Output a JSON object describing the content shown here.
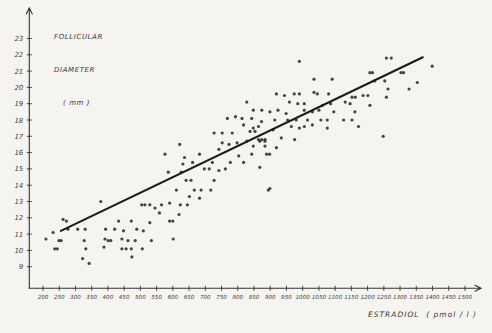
{
  "figure": {
    "y_axis_title": {
      "line1": "FOLLICULAR",
      "line2": "DIAMETER",
      "line3": "( mm )"
    },
    "x_axis_title": "ESTRADIOL  ( pmol / l )"
  },
  "chart_data": {
    "type": "scatter",
    "title": "",
    "xlabel": "ESTRADIOL (pmol/l)",
    "ylabel": "FOLLICULAR DIAMETER (mm)",
    "xlim": [
      150,
      1550
    ],
    "ylim": [
      8,
      24
    ],
    "grid": false,
    "legend": "none",
    "x_ticks": [
      200,
      250,
      300,
      350,
      400,
      450,
      500,
      550,
      600,
      650,
      700,
      750,
      800,
      850,
      900,
      950,
      1000,
      1050,
      1100,
      1150,
      1200,
      1250,
      1300,
      1350,
      1400,
      1450,
      1500
    ],
    "y_ticks": [
      9,
      10,
      11,
      12,
      13,
      14,
      15,
      16,
      17,
      18,
      19,
      20,
      21,
      22,
      23
    ],
    "point_color": "#2e2c28",
    "line_color": "#1d1b17",
    "trend_line": {
      "x1": 255,
      "y1": 11.2,
      "x2": 1370,
      "y2": 21.85
    },
    "points": [
      [
        209,
        10.7
      ],
      [
        231,
        11.1
      ],
      [
        236,
        10.1
      ],
      [
        244,
        10.1
      ],
      [
        249,
        10.6
      ],
      [
        256,
        10.6
      ],
      [
        262,
        11.9
      ],
      [
        272,
        11.8
      ],
      [
        277,
        11.3
      ],
      [
        307,
        11.3
      ],
      [
        322,
        9.5
      ],
      [
        327,
        10.6
      ],
      [
        330,
        11.3
      ],
      [
        332,
        10.1
      ],
      [
        342,
        9.2
      ],
      [
        378,
        13.0
      ],
      [
        388,
        10.2
      ],
      [
        391,
        10.7
      ],
      [
        393,
        11.3
      ],
      [
        401,
        10.6
      ],
      [
        409,
        10.6
      ],
      [
        421,
        11.3
      ],
      [
        433,
        11.8
      ],
      [
        443,
        10.7
      ],
      [
        443,
        10.1
      ],
      [
        448,
        11.2
      ],
      [
        456,
        10.1
      ],
      [
        462,
        10.6
      ],
      [
        472,
        11.8
      ],
      [
        472,
        10.1
      ],
      [
        474,
        9.6
      ],
      [
        484,
        10.6
      ],
      [
        489,
        11.3
      ],
      [
        504,
        12.8
      ],
      [
        506,
        10.1
      ],
      [
        509,
        11.2
      ],
      [
        514,
        12.8
      ],
      [
        529,
        12.8
      ],
      [
        529,
        11.7
      ],
      [
        534,
        10.6
      ],
      [
        545,
        12.6
      ],
      [
        559,
        12.3
      ],
      [
        565,
        12.8
      ],
      [
        590,
        12.9
      ],
      [
        590,
        11.8
      ],
      [
        600,
        11.8
      ],
      [
        601,
        10.7
      ],
      [
        619,
        12.2
      ],
      [
        623,
        12.8
      ],
      [
        645,
        12.8
      ],
      [
        651,
        13.3
      ],
      [
        682,
        13.2
      ],
      [
        576,
        15.9
      ],
      [
        586,
        14.8
      ],
      [
        611,
        13.7
      ],
      [
        621,
        16.5
      ],
      [
        626,
        14.8
      ],
      [
        631,
        15.3
      ],
      [
        636,
        15.7
      ],
      [
        641,
        14.3
      ],
      [
        656,
        14.3
      ],
      [
        661,
        15.4
      ],
      [
        666,
        13.7
      ],
      [
        682,
        15.9
      ],
      [
        687,
        13.7
      ],
      [
        697,
        15.0
      ],
      [
        712,
        15.0
      ],
      [
        717,
        13.7
      ],
      [
        722,
        15.4
      ],
      [
        727,
        14.3
      ],
      [
        727,
        17.2
      ],
      [
        742,
        14.9
      ],
      [
        742,
        16.2
      ],
      [
        752,
        16.6
      ],
      [
        752,
        17.2
      ],
      [
        762,
        15.0
      ],
      [
        768,
        18.1
      ],
      [
        773,
        16.5
      ],
      [
        777,
        15.4
      ],
      [
        783,
        17.2
      ],
      [
        793,
        18.2
      ],
      [
        798,
        16.6
      ],
      [
        803,
        15.8
      ],
      [
        813,
        18.1
      ],
      [
        818,
        15.4
      ],
      [
        818,
        17.7
      ],
      [
        828,
        16.7
      ],
      [
        828,
        19.1
      ],
      [
        838,
        17.3
      ],
      [
        843,
        15.9
      ],
      [
        843,
        18.1
      ],
      [
        848,
        16.4
      ],
      [
        848,
        17.5
      ],
      [
        848,
        18.6
      ],
      [
        853,
        17.3
      ],
      [
        864,
        16.8
      ],
      [
        864,
        17.6
      ],
      [
        868,
        15.1
      ],
      [
        868,
        16.7
      ],
      [
        873,
        17.9
      ],
      [
        874,
        16.8
      ],
      [
        874,
        18.6
      ],
      [
        884,
        16.4
      ],
      [
        884,
        16.7
      ],
      [
        884,
        16.8
      ],
      [
        889,
        15.9
      ],
      [
        894,
        13.7
      ],
      [
        898,
        15.9
      ],
      [
        899,
        13.8
      ],
      [
        899,
        18.5
      ],
      [
        909,
        17.4
      ],
      [
        914,
        18.0
      ],
      [
        919,
        16.3
      ],
      [
        919,
        19.6
      ],
      [
        924,
        18.6
      ],
      [
        934,
        16.9
      ],
      [
        944,
        19.5
      ],
      [
        949,
        18.4
      ],
      [
        954,
        18.0
      ],
      [
        959,
        19.1
      ],
      [
        965,
        17.6
      ],
      [
        974,
        19.6
      ],
      [
        975,
        16.8
      ],
      [
        980,
        18.0
      ],
      [
        985,
        19.0
      ],
      [
        990,
        17.5
      ],
      [
        990,
        19.6
      ],
      [
        990,
        21.6
      ],
      [
        1005,
        17.6
      ],
      [
        1005,
        18.6
      ],
      [
        1005,
        19.0
      ],
      [
        1015,
        18.0
      ],
      [
        1030,
        17.7
      ],
      [
        1030,
        18.5
      ],
      [
        1035,
        19.7
      ],
      [
        1035,
        20.5
      ],
      [
        1045,
        19.6
      ],
      [
        1050,
        18.6
      ],
      [
        1056,
        18.0
      ],
      [
        1061,
        18.9
      ],
      [
        1076,
        17.5
      ],
      [
        1076,
        18.0
      ],
      [
        1080,
        19.6
      ],
      [
        1086,
        19.0
      ],
      [
        1091,
        20.5
      ],
      [
        1096,
        18.5
      ],
      [
        1126,
        18.0
      ],
      [
        1131,
        19.1
      ],
      [
        1146,
        19.0
      ],
      [
        1152,
        18.0
      ],
      [
        1152,
        19.4
      ],
      [
        1161,
        18.5
      ],
      [
        1162,
        19.4
      ],
      [
        1172,
        17.6
      ],
      [
        1186,
        19.5
      ],
      [
        1201,
        19.5
      ],
      [
        1207,
        18.9
      ],
      [
        1207,
        20.9
      ],
      [
        1215,
        20.9
      ],
      [
        1222,
        20.4
      ],
      [
        1248,
        17.0
      ],
      [
        1253,
        20.4
      ],
      [
        1258,
        19.4
      ],
      [
        1258,
        21.8
      ],
      [
        1263,
        19.9
      ],
      [
        1273,
        21.8
      ],
      [
        1303,
        20.9
      ],
      [
        1311,
        20.9
      ],
      [
        1328,
        19.9
      ],
      [
        1353,
        20.3
      ],
      [
        1399,
        21.3
      ]
    ]
  }
}
